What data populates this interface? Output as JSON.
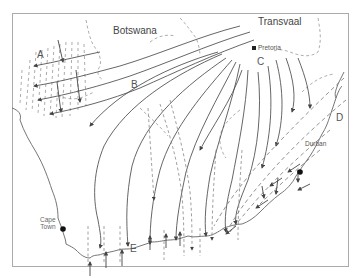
{
  "diagram": {
    "type": "map-flow-diagram",
    "regions": {
      "botswana": "Botswana",
      "transvaal": "Transvaal"
    },
    "cities": {
      "pretoria": "Pretoria",
      "durban": "Durban",
      "cape_town_line1": "Cape",
      "cape_town_line2": "Town"
    },
    "letters": {
      "a": "A",
      "b": "B",
      "c": "C",
      "d": "D",
      "e": "E"
    },
    "legend_styles": {
      "solid_line": "flow line with arrow",
      "dashed_line": "dashed line / boundary"
    },
    "colors": {
      "line": "#555555",
      "dashed": "#888888",
      "border": "#aaaaaa",
      "city_marker": "#111111"
    }
  }
}
